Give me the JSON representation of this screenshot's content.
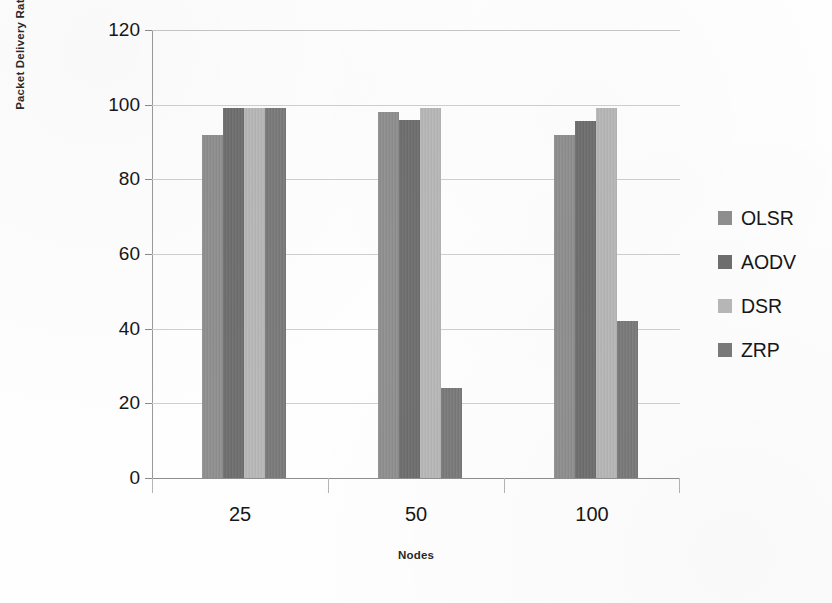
{
  "chart_data": {
    "type": "bar",
    "title": "",
    "subtitle": "",
    "xlabel": "Nodes",
    "ylabel": "Packet Delivery Ratio(%)",
    "categories": [
      "25",
      "50",
      "100"
    ],
    "series": [
      {
        "name": "OLSR",
        "color": "#8f8f8f",
        "values": [
          92,
          98,
          92
        ]
      },
      {
        "name": "AODV",
        "color": "#6e6e6e",
        "values": [
          99,
          96,
          95.5
        ]
      },
      {
        "name": "DSR",
        "color": "#b8b8b8",
        "values": [
          99,
          99,
          99
        ]
      },
      {
        "name": "ZRP",
        "color": "#7a7a7a",
        "values": [
          99,
          24,
          42
        ]
      }
    ],
    "ylim": [
      0,
      120
    ],
    "yticks": [
      0,
      20,
      40,
      60,
      80,
      100,
      120
    ],
    "ytick_labels": [
      "0",
      "20",
      "40",
      "60",
      "80",
      "100",
      "120"
    ],
    "grid": true,
    "grid_axis": "y",
    "legend_position": "right",
    "bar_group_count": 3,
    "bars_per_group": 4
  },
  "axes": {
    "y_title": "Packet Delivery Ratio(%)",
    "x_title": "Nodes"
  },
  "legend": {
    "items": [
      {
        "label": "OLSR",
        "swatch_color": "#8f8f8f"
      },
      {
        "label": "AODV",
        "swatch_color": "#6e6e6e"
      },
      {
        "label": "DSR",
        "swatch_color": "#b8b8b8"
      },
      {
        "label": "ZRP",
        "swatch_color": "#7a7a7a"
      }
    ]
  },
  "colors": {
    "gridline": "#cfcfcf",
    "axis": "#8e8e8e",
    "text": "#171717",
    "background": "#fefefe"
  }
}
